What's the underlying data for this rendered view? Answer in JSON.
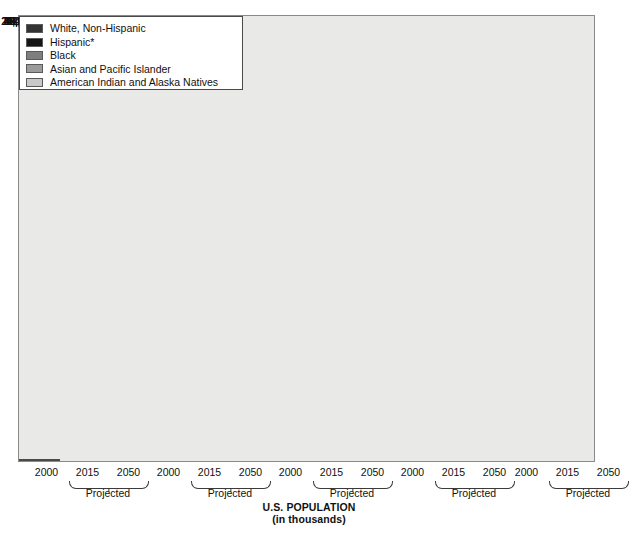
{
  "chart_data": {
    "type": "bar",
    "title": "U.S. POPULATION",
    "subtitle": "(in thousands)",
    "xlabel": "",
    "ylabel": "",
    "ylim": [
      0,
      212991
    ],
    "grid": false,
    "legend_position": "top-right",
    "categories": [
      "2000",
      "2015",
      "2050"
    ],
    "projected_note": "Projected",
    "projected_covers": [
      "2015",
      "2050"
    ],
    "series": [
      {
        "name": "White, Non-Hispanic",
        "color": "#333333",
        "values": [
          211460,
          204590,
          212991
        ],
        "labels": [
          "211,460",
          "204,590",
          "212,991"
        ]
      },
      {
        "name": "Hispanic*",
        "color": "#151515",
        "values": [
          35305,
          49255,
          98229
        ],
        "labels": [
          "35,305",
          "49,255",
          "98,229"
        ]
      },
      {
        "name": "Black",
        "color": "#7f7f7f",
        "values": [
          34658,
          39531,
          53466
        ],
        "labels": [
          "34,658",
          "39,531",
          "53,466"
        ]
      },
      {
        "name": "Asian and Pacific Islander",
        "color": "#9b9b9b",
        "values": [
          10641,
          16441,
          37589
        ],
        "labels": [
          "10,641",
          "16,441",
          "37,589"
        ]
      },
      {
        "name": "American Indian and Alaska Natives",
        "color": "#c9c9c9",
        "values": [
          2475,
          3016,
          4405
        ],
        "labels": [
          "2,475",
          "3,016",
          "4,405"
        ]
      }
    ]
  },
  "legend": {
    "items": [
      {
        "label": "White, Non-Hispanic",
        "color": "#333333"
      },
      {
        "label": "Hispanic*",
        "color": "#151515"
      },
      {
        "label": "Black",
        "color": "#7f7f7f"
      },
      {
        "label": "Asian and Pacific Islander",
        "color": "#9b9b9b"
      },
      {
        "label": "American Indian and Alaska Natives",
        "color": "#c9c9c9"
      }
    ]
  },
  "axis": {
    "groups": [
      {
        "ticks": [
          "2000",
          "2015",
          "2050"
        ]
      },
      {
        "ticks": [
          "2000",
          "2015",
          "2050"
        ]
      },
      {
        "ticks": [
          "2000",
          "2015",
          "2050"
        ]
      },
      {
        "ticks": [
          "2000",
          "2015",
          "2050"
        ]
      },
      {
        "ticks": [
          "2000",
          "2015",
          "2050"
        ]
      }
    ],
    "projected_label": "Projected"
  },
  "layout": {
    "plot": {
      "left": 18,
      "top": 15,
      "width": 577,
      "height": 447
    },
    "baseline_y": 461,
    "top_value_y": 58,
    "bar_width": 41,
    "group_starts": [
      26,
      148,
      270,
      392,
      506
    ],
    "bar_gap": 41,
    "legend_box": {
      "left": 368,
      "top": 31,
      "width": 224,
      "height": 74
    },
    "tick_row_y": 466,
    "brace_y": 481,
    "proj_y": 487,
    "title_y": 502
  }
}
